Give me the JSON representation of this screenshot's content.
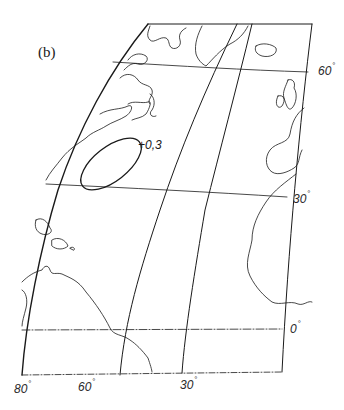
{
  "figure": {
    "panel_label": "(b)",
    "contour": {
      "label": "+0,3",
      "value": 0.3
    },
    "latitude_labels": [
      {
        "text": "60",
        "deg": "°"
      },
      {
        "text": "30",
        "deg": "°"
      },
      {
        "text": "0",
        "deg": "°"
      }
    ],
    "longitude_labels": [
      {
        "text": "80",
        "deg": "°"
      },
      {
        "text": "60",
        "deg": "°"
      },
      {
        "text": "30",
        "deg": "°"
      }
    ],
    "colors": {
      "ink": "#1a1a1a",
      "grid": "#333333",
      "background": "#ffffff"
    }
  }
}
